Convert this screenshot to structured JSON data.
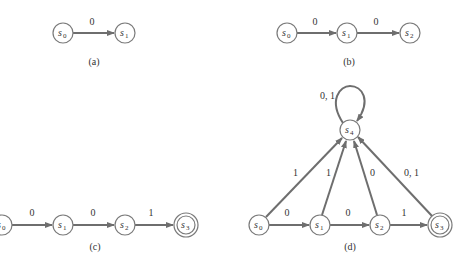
{
  "colors": {
    "edge": "#6e6e6e",
    "state_stroke": "#7a7a7a",
    "text": "#333333"
  },
  "panels": {
    "a": {
      "caption": "(a)",
      "states": [
        {
          "name": "s",
          "sub": "0"
        },
        {
          "name": "s",
          "sub": "1"
        }
      ],
      "transitions": [
        {
          "from": "s0",
          "to": "s1",
          "label": "0"
        }
      ]
    },
    "b": {
      "caption": "(b)",
      "states": [
        {
          "name": "s",
          "sub": "0"
        },
        {
          "name": "s",
          "sub": "1"
        },
        {
          "name": "s",
          "sub": "2"
        }
      ],
      "transitions": [
        {
          "from": "s0",
          "to": "s1",
          "label": "0"
        },
        {
          "from": "s1",
          "to": "s2",
          "label": "0"
        }
      ]
    },
    "c": {
      "caption": "(c)",
      "states": [
        {
          "name": "s",
          "sub": "0"
        },
        {
          "name": "s",
          "sub": "1"
        },
        {
          "name": "s",
          "sub": "2"
        },
        {
          "name": "s",
          "sub": "3",
          "final": true
        }
      ],
      "transitions": [
        {
          "from": "s0",
          "to": "s1",
          "label": "0"
        },
        {
          "from": "s1",
          "to": "s2",
          "label": "0"
        },
        {
          "from": "s2",
          "to": "s3",
          "label": "1"
        }
      ]
    },
    "d": {
      "caption": "(d)",
      "states": [
        {
          "name": "s",
          "sub": "0"
        },
        {
          "name": "s",
          "sub": "1"
        },
        {
          "name": "s",
          "sub": "2"
        },
        {
          "name": "s",
          "sub": "3",
          "final": true
        },
        {
          "name": "s",
          "sub": "4"
        }
      ],
      "transitions": [
        {
          "from": "s0",
          "to": "s1",
          "label": "0"
        },
        {
          "from": "s1",
          "to": "s2",
          "label": "0"
        },
        {
          "from": "s2",
          "to": "s3",
          "label": "1"
        },
        {
          "from": "s0",
          "to": "s4",
          "label": "1"
        },
        {
          "from": "s1",
          "to": "s4",
          "label": "1"
        },
        {
          "from": "s2",
          "to": "s4",
          "label": "0"
        },
        {
          "from": "s3",
          "to": "s4",
          "label": "0, 1"
        },
        {
          "from": "s4",
          "to": "s4",
          "label": "0, 1"
        }
      ]
    }
  }
}
